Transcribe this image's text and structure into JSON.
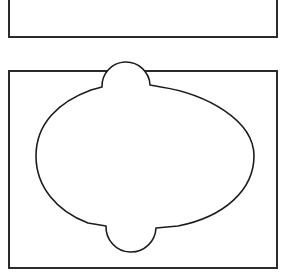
{
  "figure": {
    "background_color": "#ffffff",
    "stroke_color": "#1c1c1c",
    "frame_color": "#2b2b2b",
    "frame_stroke_width_px": 2,
    "shape_stroke_width_px": 1.6,
    "panel_count": 2,
    "canvas_width_px": 286,
    "canvas_height_px": 274
  },
  "panels": [
    {
      "id": "panel-top",
      "name": "top-panel",
      "label": "",
      "clipped": true,
      "clip_note": "cropped at top edge of image",
      "frame": {
        "x": 8,
        "y": -46,
        "width": 270,
        "height": 84
      },
      "shape": {
        "name": "oval-with-bumps",
        "description": "ellipse with semicircular bump on top and semicircular bump on bottom",
        "path": "M 26 -64 C 26 -100 70 -124 126 -124 C 182 -124 226 -100 226 -64 C 226 -28 182 -4 126 -4 C 70 -4 26 -28 26 -64 Z",
        "bottom_bump": {
          "center_x": 100,
          "center_y": -6,
          "radius": 24
        },
        "top_bump": {
          "center_x": 96,
          "center_y": -122,
          "radius": 24
        }
      }
    },
    {
      "id": "panel-bottom",
      "name": "bottom-panel",
      "label": "",
      "clipped": false,
      "frame": {
        "x": 8,
        "y": 70,
        "width": 270,
        "height": 199
      },
      "shape": {
        "name": "oval-with-bumps",
        "description": "ellipse with semicircular bump on top and semicircular bump on bottom",
        "left_x": 34,
        "right_x": 252,
        "top_y": 92,
        "bottom_y": 226,
        "top_bump": {
          "left_x": 100,
          "right_x": 148,
          "peak_y": 80,
          "radius": 24
        },
        "bottom_bump": {
          "left_x": 102,
          "right_x": 152,
          "base_y": 242,
          "radius": 25
        }
      }
    }
  ],
  "colors": {
    "background": "#ffffff",
    "outline": "#1c1c1c",
    "frame": "#2b2b2b"
  }
}
